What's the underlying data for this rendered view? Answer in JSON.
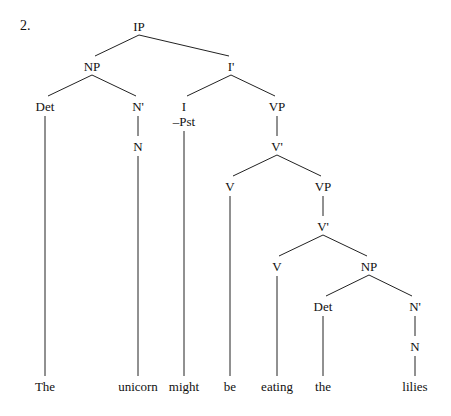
{
  "example_number": "2.",
  "tree": {
    "nodes": {
      "ip": {
        "label": "IP",
        "x": 139,
        "y": 20
      },
      "np1": {
        "label": "NP",
        "x": 92,
        "y": 60
      },
      "ibar": {
        "label": "I'",
        "x": 231,
        "y": 60
      },
      "det1": {
        "label": "Det",
        "x": 45,
        "y": 100
      },
      "nbar1": {
        "label": "N'",
        "x": 138,
        "y": 100
      },
      "i": {
        "label": "I",
        "x": 184,
        "y": 100
      },
      "pst": {
        "label": "–Pst",
        "x": 184,
        "y": 115
      },
      "vp1": {
        "label": "VP",
        "x": 277,
        "y": 100
      },
      "n1": {
        "label": "N",
        "x": 138,
        "y": 140
      },
      "vbar1": {
        "label": "V'",
        "x": 277,
        "y": 140
      },
      "v1": {
        "label": "V",
        "x": 230,
        "y": 180
      },
      "vp2": {
        "label": "VP",
        "x": 323,
        "y": 180
      },
      "vbar2": {
        "label": "V'",
        "x": 323,
        "y": 220
      },
      "v2": {
        "label": "V",
        "x": 277,
        "y": 260
      },
      "np2": {
        "label": "NP",
        "x": 369,
        "y": 260
      },
      "det2": {
        "label": "Det",
        "x": 323,
        "y": 300
      },
      "nbar2": {
        "label": "N'",
        "x": 415,
        "y": 300
      },
      "n2": {
        "label": "N",
        "x": 415,
        "y": 340
      }
    },
    "words": [
      {
        "text": "The",
        "x": 45
      },
      {
        "text": "unicorn",
        "x": 138
      },
      {
        "text": "might",
        "x": 184
      },
      {
        "text": "be",
        "x": 230
      },
      {
        "text": "eating",
        "x": 277
      },
      {
        "text": "the",
        "x": 323
      },
      {
        "text": "lilies",
        "x": 415
      }
    ],
    "word_y": 380
  }
}
